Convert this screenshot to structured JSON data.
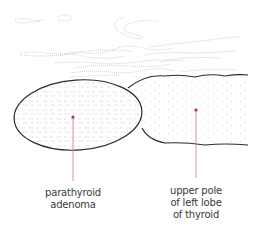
{
  "diagram": {
    "type": "anatomical-illustration",
    "colors": {
      "outline": "#2b2b2b",
      "texture": "#9a9a9a",
      "pointer": "#d9506e",
      "pointer_dot": "#b0304e",
      "label_text": "#3a3a3a",
      "background": "#ffffff"
    },
    "labels": [
      {
        "id": "parathyroid-adenoma",
        "lines": [
          "parathyroid",
          "adenoma"
        ]
      },
      {
        "id": "thyroid-upper-pole",
        "lines": [
          "upper pole",
          "of left lobe",
          "of thyroid"
        ]
      }
    ]
  }
}
